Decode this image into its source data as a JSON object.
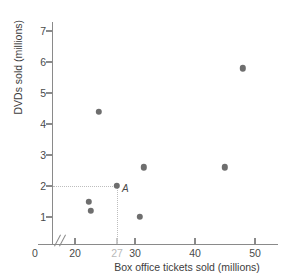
{
  "chart_data": {
    "type": "scatter",
    "title": "",
    "xlabel": "Box office tickets sold (millions)",
    "ylabel": "DVDs sold (millions)",
    "xlim": [
      18,
      52
    ],
    "ylim": [
      0,
      7.6
    ],
    "grid": false,
    "legend": null,
    "x_axis_break": true,
    "origin_label": "0",
    "yticks": [
      {
        "value": 7,
        "label": "7"
      },
      {
        "value": 6,
        "label": "6"
      },
      {
        "value": 5,
        "label": "5"
      },
      {
        "value": 4,
        "label": "4"
      },
      {
        "value": 3,
        "label": "3"
      },
      {
        "value": 2,
        "label": "2"
      },
      {
        "value": 1,
        "label": "1"
      }
    ],
    "xticks": [
      {
        "value": 20,
        "label": "20",
        "highlight": false
      },
      {
        "value": 27,
        "label": "27",
        "highlight": true
      },
      {
        "value": 30,
        "label": "30",
        "highlight": false
      },
      {
        "value": 40,
        "label": "40",
        "highlight": false
      },
      {
        "value": 50,
        "label": "50",
        "highlight": false
      }
    ],
    "points": [
      {
        "x": 24.0,
        "y": 4.4,
        "label": ""
      },
      {
        "x": 22.3,
        "y": 1.5,
        "label": ""
      },
      {
        "x": 22.6,
        "y": 1.2,
        "label": ""
      },
      {
        "x": 27.0,
        "y": 2.0,
        "label": "A"
      },
      {
        "x": 31.5,
        "y": 2.6,
        "label": ""
      },
      {
        "x": 30.8,
        "y": 1.0,
        "label": ""
      },
      {
        "x": 45.0,
        "y": 2.6,
        "label": ""
      },
      {
        "x": 48.0,
        "y": 5.8,
        "label": ""
      }
    ],
    "guides": [
      {
        "orientation": "horizontal",
        "value": 2.0,
        "from": 18,
        "to": 27
      },
      {
        "orientation": "vertical",
        "value": 27.0,
        "from": 0,
        "to": 2.0
      }
    ],
    "colors": {
      "point": "#6e6e6e",
      "axis": "#8a8a8a",
      "guide": "#bdbdbd",
      "highlight_tick": "#b9b9b9",
      "text": "#3d3d3d"
    }
  }
}
